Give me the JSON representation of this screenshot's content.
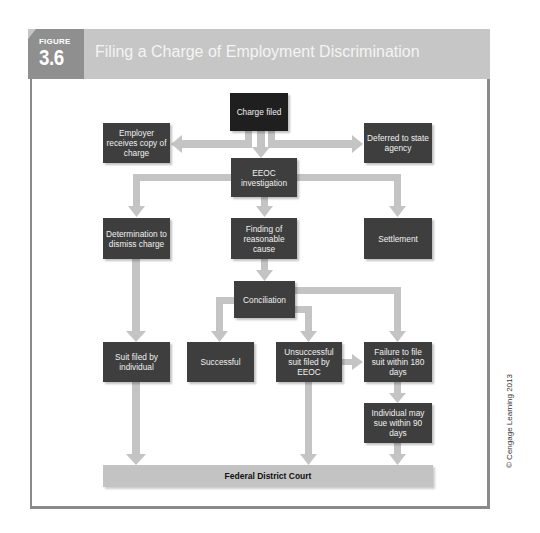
{
  "header": {
    "figure_label": "FIGURE",
    "figure_number": "3.6",
    "title": "Filing a Charge of Employment Discrimination"
  },
  "nodes": {
    "charge_filed": "Charge filed",
    "employer_copy": "Employer receives copy of charge",
    "deferred": "Deferred to state agency",
    "eeoc_investigation": "EEOC investigation",
    "determination_dismiss": "Determination to dismiss charge",
    "finding_cause": "Finding of reasonable cause",
    "settlement": "Settlement",
    "conciliation": "Conciliation",
    "suit_individual": "Suit filed by individual",
    "successful": "Successful",
    "unsuccessful_eeoc": "Unsuccessful suit filed by EEOC",
    "failure_180": "Failure to file suit within 180 days",
    "individual_90": "Individual may sue within 90 days",
    "federal_court": "Federal District Court"
  },
  "edges": [
    {
      "from": "charge_filed",
      "to": "employer_copy"
    },
    {
      "from": "charge_filed",
      "to": "eeoc_investigation"
    },
    {
      "from": "charge_filed",
      "to": "deferred"
    },
    {
      "from": "eeoc_investigation",
      "to": "determination_dismiss"
    },
    {
      "from": "eeoc_investigation",
      "to": "finding_cause"
    },
    {
      "from": "eeoc_investigation",
      "to": "settlement"
    },
    {
      "from": "finding_cause",
      "to": "conciliation"
    },
    {
      "from": "determination_dismiss",
      "to": "suit_individual"
    },
    {
      "from": "conciliation",
      "to": "successful"
    },
    {
      "from": "conciliation",
      "to": "unsuccessful_eeoc"
    },
    {
      "from": "conciliation",
      "to": "failure_180"
    },
    {
      "from": "unsuccessful_eeoc",
      "to": "failure_180"
    },
    {
      "from": "failure_180",
      "to": "individual_90"
    },
    {
      "from": "suit_individual",
      "to": "federal_court"
    },
    {
      "from": "unsuccessful_eeoc",
      "to": "federal_court"
    },
    {
      "from": "individual_90",
      "to": "federal_court"
    }
  ],
  "copyright": "© Cengage Learning 2013",
  "colors": {
    "header_band": "#c6c6c6",
    "figure_tab": "#8f8f8f",
    "box_fill": "#3e3e3e",
    "arrow": "#c4c4c4",
    "court_bar": "#c3c3c3"
  }
}
